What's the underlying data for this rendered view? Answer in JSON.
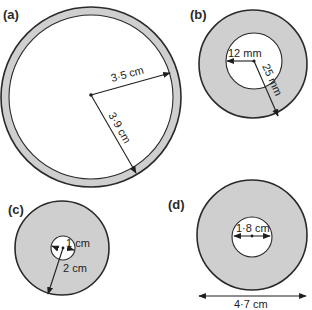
{
  "figure": {
    "panels": [
      {
        "id": "a",
        "label": "(a)",
        "shape": "annulus",
        "inner_radius": "3·5 cm",
        "outer_radius": "3·9 cm",
        "dimensions": [
          "3·5 cm",
          "3·9 cm"
        ]
      },
      {
        "id": "b",
        "label": "(b)",
        "shape": "annulus",
        "inner_radius": "12 mm",
        "outer_radius": "25 mm",
        "dimensions": [
          "12 mm",
          "25 mm"
        ]
      },
      {
        "id": "c",
        "label": "(c)",
        "shape": "annulus",
        "inner_radius": "1 cm",
        "outer_radius": "2 cm",
        "dimensions": [
          "1 cm",
          "2 cm"
        ]
      },
      {
        "id": "d",
        "label": "(d)",
        "shape": "annulus",
        "inner_diameter": "1·8 cm",
        "outer_diameter": "4·7 cm",
        "dimensions": [
          "1·8 cm",
          "4·7 cm"
        ]
      }
    ],
    "colors": {
      "ring_fill": "#cfcfcf",
      "outline": "#2a2a2a",
      "background": "#ffffff"
    }
  }
}
